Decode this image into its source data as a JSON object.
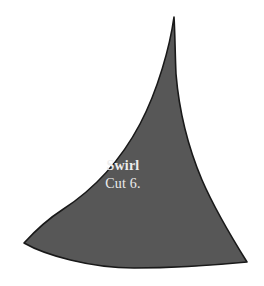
{
  "page": {
    "background_color": "#ffffff",
    "width": 264,
    "height": 286
  },
  "pattern_piece": {
    "icon_name": "sail-fin-pattern-shape",
    "fill_color": "#575757",
    "outline_color": "#191919",
    "outline_width": 1.6,
    "label_color": "#ededed",
    "name_label": "Swirl",
    "cut_label": "Cut 6.",
    "outline_path": "M 174 17 C 170 46 158 90 140 124 C 122 158 96 188 62 210 C 48 219 36 230 24 243 C 45 255 90 268 134 268 C 178 268 216 265 247 262 C 232 238 215 210 202 180 C 188 147 179 110 176 74 C 175 52 175 32 174 17 Z"
  }
}
